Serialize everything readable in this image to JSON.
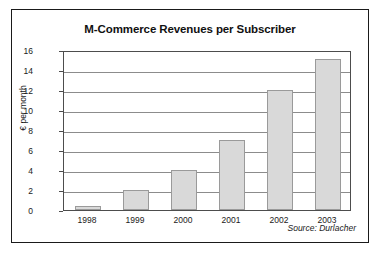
{
  "chart_data": {
    "type": "bar",
    "title": "M-Commerce Revenues per Subscriber",
    "xlabel": "",
    "ylabel": "€ per month",
    "categories": [
      "1998",
      "1999",
      "2000",
      "2001",
      "2002",
      "2003"
    ],
    "values": [
      0.4,
      2,
      4,
      7,
      12,
      15.1
    ],
    "ylim": [
      0,
      16
    ],
    "yticks": [
      0,
      2,
      4,
      6,
      8,
      10,
      12,
      14,
      16
    ],
    "ytick_labels": [
      "0",
      "2",
      "4",
      "6",
      "8",
      "10",
      "12",
      "14",
      "16"
    ],
    "grid": true,
    "legend": false,
    "annotations": [
      "Source: Durlacher"
    ],
    "bar_fill_color": "#d9d9d9",
    "bar_edge_color": "#9a9a9a",
    "gridline_color": "#8c8c8c",
    "axis_color": "#4d4d4d",
    "frame_color": "#1a1a1a",
    "background_color": "#ffffff"
  },
  "figure": {
    "source_note": "Source: Durlacher"
  }
}
